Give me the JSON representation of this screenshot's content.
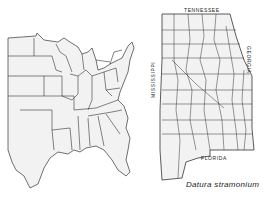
{
  "figure": {
    "caption": "Datura stramonium",
    "labels": {
      "north": "TENNESSEE",
      "west": "MISSISSIPPI",
      "east": "GEORGIA",
      "south": "FLORIDA"
    },
    "panels": [
      {
        "name": "eastern-united-states",
        "description": "Outline map of eastern US states"
      },
      {
        "name": "alabama-counties",
        "description": "Alabama county outline map"
      }
    ],
    "colors": {
      "line": "#333333",
      "fill": "#f2f2f2",
      "background": "#ffffff"
    }
  }
}
